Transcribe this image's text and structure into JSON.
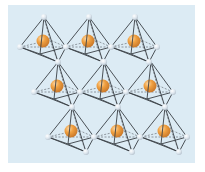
{
  "diagram": {
    "colors": {
      "background": "#dcebf4",
      "page": "#ffffff",
      "edge": "#3a3f45",
      "vertex_atom": "#dde6ee",
      "center_atom_light": "#fbd7a6",
      "center_atom": "#f0a040",
      "center_atom_dark": "#c9782a"
    },
    "octahedron_offsets": {
      "top": [
        0,
        0
      ],
      "left": [
        -24,
        30
      ],
      "right": [
        22,
        30
      ],
      "front": [
        -4,
        37
      ],
      "back": [
        6,
        23
      ],
      "bottom": [
        14,
        45
      ],
      "center": [
        -1,
        24
      ]
    },
    "octahedra": [
      {
        "row": 1,
        "col": 1,
        "top": [
          44,
          17
        ]
      },
      {
        "row": 1,
        "col": 2,
        "top": [
          89,
          17
        ]
      },
      {
        "row": 1,
        "col": 3,
        "top": [
          135,
          17
        ]
      },
      {
        "row": 2,
        "col": 1,
        "top": [
          58,
          62
        ]
      },
      {
        "row": 2,
        "col": 2,
        "top": [
          104,
          62
        ]
      },
      {
        "row": 2,
        "col": 3,
        "top": [
          151,
          62
        ]
      },
      {
        "row": 3,
        "col": 1,
        "top": [
          72,
          107
        ]
      },
      {
        "row": 3,
        "col": 2,
        "top": [
          118,
          107
        ]
      },
      {
        "row": 3,
        "col": 3,
        "top": [
          165,
          107
        ]
      }
    ],
    "vertex_radius": 3,
    "center_radius": 6.5
  }
}
